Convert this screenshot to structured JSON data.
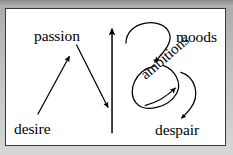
{
  "figure": {
    "type": "concept-arrow-diagram",
    "background_color": "#c2c2c2",
    "panel_color": "#ffffff",
    "border_color": "#3a3a3a",
    "ink_color": "#000000",
    "nodes": [
      {
        "id": "passion",
        "label": "passion",
        "x": 59,
        "y": 27,
        "rotation": 0
      },
      {
        "id": "desire",
        "label": "desire",
        "x": 31,
        "y": 120,
        "rotation": 0
      },
      {
        "id": "moods",
        "label": "moods",
        "x": 197,
        "y": 28,
        "rotation": 0
      },
      {
        "id": "ambitions",
        "label": "ambitions",
        "x": 163,
        "y": 77,
        "rotation": -41
      },
      {
        "id": "despair",
        "label": "despair",
        "x": 182,
        "y": 121,
        "rotation": 0
      }
    ],
    "edges": [
      {
        "id": "desire-to-passion",
        "from": "desire",
        "to": "passion",
        "style": "straight"
      },
      {
        "id": "passion-downward",
        "from": "passion",
        "to": "",
        "style": "straight"
      },
      {
        "id": "center-upward",
        "from": "",
        "to": "",
        "style": "straight-vertical"
      },
      {
        "id": "moods-to-ambitions",
        "from": "moods",
        "to": "ambitions",
        "style": "curved"
      },
      {
        "id": "ambitions-self-loop",
        "from": "ambitions",
        "to": "ambitions",
        "style": "ellipse-loop"
      },
      {
        "id": "ambitions-to-despair",
        "from": "ambitions",
        "to": "despair",
        "style": "curved"
      },
      {
        "id": "despair-to-ambitions",
        "from": "despair",
        "to": "ambitions",
        "style": "curved"
      }
    ]
  }
}
